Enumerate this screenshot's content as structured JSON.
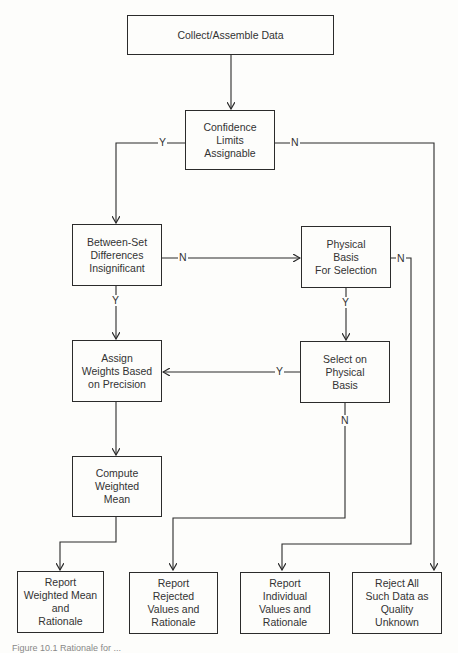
{
  "diagram": {
    "type": "flowchart",
    "nodes": {
      "collect": "Collect/Assemble Data",
      "confidence": "Confidence\nLimits\nAssignable",
      "between_set": "Between-Set\nDifferences\nInsignificant",
      "physical_basis": "Physical\nBasis\nFor Selection",
      "assign_weights": "Assign\nWeights Based\non Precision",
      "select_physical": "Select on\nPhysical\nBasis",
      "compute_mean": "Compute\nWeighted\nMean",
      "report_weighted": "Report\nWeighted Mean\nand\nRationale",
      "report_rejected": "Report\nRejected\nValues and\nRationale",
      "report_individual": "Report\nIndividual\nValues and\nRationale",
      "reject_all": "Reject All\nSuch Data as\nQuality\nUnknown"
    },
    "edge_labels": {
      "confidence_yes": "Y",
      "confidence_no": "N",
      "between_no": "N",
      "between_yes": "Y",
      "physical_yes": "Y",
      "physical_no": "N",
      "select_yes": "Y",
      "select_no": "N"
    },
    "edges": [
      {
        "from": "collect",
        "to": "confidence",
        "label": ""
      },
      {
        "from": "confidence",
        "to": "between_set",
        "label": "Y"
      },
      {
        "from": "confidence",
        "to": "reject_all",
        "label": "N"
      },
      {
        "from": "between_set",
        "to": "physical_basis",
        "label": "N"
      },
      {
        "from": "between_set",
        "to": "assign_weights",
        "label": "Y"
      },
      {
        "from": "physical_basis",
        "to": "select_physical",
        "label": "Y"
      },
      {
        "from": "physical_basis",
        "to": "report_individual",
        "label": "N"
      },
      {
        "from": "select_physical",
        "to": "assign_weights",
        "label": "Y"
      },
      {
        "from": "select_physical",
        "to": "report_rejected",
        "label": "N"
      },
      {
        "from": "assign_weights",
        "to": "compute_mean",
        "label": ""
      },
      {
        "from": "compute_mean",
        "to": "report_weighted",
        "label": ""
      }
    ],
    "caption_partial": "Figure 10.1   Rationale for ..."
  }
}
